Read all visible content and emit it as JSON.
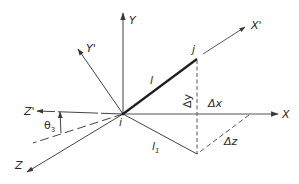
{
  "diagram": {
    "origin": {
      "label": "i",
      "x": 123,
      "y": 114
    },
    "end_point": {
      "label": "j",
      "x": 197,
      "y": 58
    },
    "axes": [
      {
        "name": "Y",
        "label": "Y",
        "to": [
          123,
          12
        ],
        "style": "solid"
      },
      {
        "name": "Y-prime",
        "label": "Y'",
        "to": [
          77,
          48
        ],
        "style": "solid"
      },
      {
        "name": "X",
        "label": "X",
        "to": [
          280,
          114
        ],
        "style": "solid"
      },
      {
        "name": "X-prime",
        "label": "X'",
        "to": [
          247,
          26
        ],
        "style": "solid"
      },
      {
        "name": "Z-prime",
        "label": "Z'",
        "to": [
          37,
          111
        ],
        "style": "solid"
      },
      {
        "name": "Z",
        "label": "Z",
        "to": [
          25,
          174
        ],
        "style": "solid"
      }
    ],
    "labels": {
      "member_length": "l",
      "projected_length": "l",
      "projected_length_sub": "1",
      "delta_x": "Δx",
      "delta_y": "Δy",
      "delta_z": "Δz",
      "angle": "θ",
      "angle_sub": "3",
      "y_axis": "Y",
      "y_prime_axis": "Y'",
      "x_axis": "X",
      "x_prime_axis": "X'",
      "z_axis": "Z",
      "z_prime_axis": "Z'",
      "origin": "i",
      "end": "j"
    },
    "colors": {
      "line": "#3a3a3a",
      "member": "#1e1e1e",
      "background": "#ffffff"
    }
  }
}
